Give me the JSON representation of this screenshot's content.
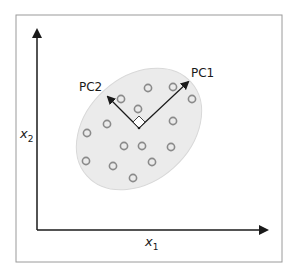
{
  "diagram": {
    "type": "pca-illustration",
    "axes": {
      "x_label": "x",
      "x_subscript": "1",
      "y_label": "x",
      "y_subscript": "2"
    },
    "vectors": [
      {
        "name": "PC1",
        "label": "PC1"
      },
      {
        "name": "PC2",
        "label": "PC2"
      }
    ],
    "data_points": [
      {
        "x": 148,
        "y": 88
      },
      {
        "x": 173,
        "y": 87
      },
      {
        "x": 192,
        "y": 99
      },
      {
        "x": 121,
        "y": 99
      },
      {
        "x": 138,
        "y": 109
      },
      {
        "x": 107,
        "y": 124
      },
      {
        "x": 173,
        "y": 121
      },
      {
        "x": 87,
        "y": 133
      },
      {
        "x": 124,
        "y": 146
      },
      {
        "x": 142,
        "y": 146
      },
      {
        "x": 171,
        "y": 147
      },
      {
        "x": 86,
        "y": 161
      },
      {
        "x": 113,
        "y": 166
      },
      {
        "x": 152,
        "y": 162
      },
      {
        "x": 133,
        "y": 178
      }
    ],
    "colors": {
      "ellipse_fill": "#ebebeb",
      "ellipse_stroke": "#d8d8d8",
      "point_stroke": "#8a8a8a",
      "axis": "#1a1a1a",
      "frame": "#9a9a9a"
    }
  }
}
